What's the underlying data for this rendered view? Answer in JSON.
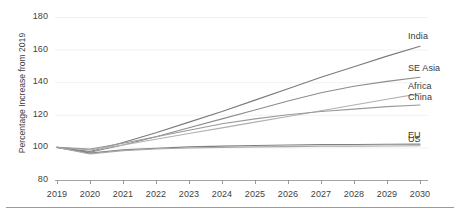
{
  "chart_data": {
    "type": "line",
    "title": "",
    "xlabel": "",
    "ylabel": "Percentage Increase from 2019",
    "x": [
      2019,
      2020,
      2021,
      2022,
      2023,
      2024,
      2025,
      2026,
      2027,
      2028,
      2029,
      2030
    ],
    "xtick_labels": [
      "2019",
      "2020",
      "2021",
      "2022",
      "2023",
      "2024",
      "2025",
      "2026",
      "2027",
      "2028",
      "2029",
      "2030"
    ],
    "ytick_labels": [
      "80",
      "100",
      "120",
      "140",
      "160",
      "180"
    ],
    "yticks": [
      80,
      100,
      120,
      140,
      160,
      180
    ],
    "ylim": [
      80,
      180
    ],
    "xlim": [
      2019,
      2030
    ],
    "grid": "horizontal-faint",
    "legend": "inline-right-labels",
    "series": [
      {
        "name": "India",
        "color": "#7a7a7a",
        "label_value": 162,
        "values": [
          100,
          97.5,
          103,
          109,
          115.5,
          122,
          129,
          136,
          143,
          149.5,
          156,
          162
        ]
      },
      {
        "name": "SE Asia",
        "color": "#8c8c8c",
        "label_value": 143,
        "values": [
          100,
          97,
          101.5,
          106.5,
          112,
          117.5,
          123,
          128.5,
          133.5,
          137.5,
          140.5,
          143
        ]
      },
      {
        "name": "Africa",
        "color": "#b0b0b0",
        "label_value": 133,
        "values": [
          100,
          98.5,
          101.5,
          105,
          108.5,
          112,
          115.5,
          119,
          122.5,
          126,
          129.5,
          133
        ]
      },
      {
        "name": "China",
        "color": "#9a9a9a",
        "label_value": 126,
        "values": [
          100,
          99,
          102.5,
          106.5,
          110.5,
          114.5,
          117.5,
          120,
          122,
          123.5,
          125,
          126
        ]
      },
      {
        "name": "EU",
        "color": "#808080",
        "label_value": 102,
        "values": [
          100,
          96.5,
          98.5,
          99.5,
          100.3,
          100.8,
          101.2,
          101.5,
          101.7,
          101.8,
          101.9,
          102
        ]
      },
      {
        "name": "US",
        "color": "#a8a8a8",
        "label_value": 101,
        "values": [
          100,
          96,
          98,
          99,
          99.6,
          100,
          100.3,
          100.5,
          100.7,
          100.8,
          100.9,
          101
        ]
      }
    ]
  },
  "axis": {
    "y_title": "Percentage Increase from 2019"
  }
}
